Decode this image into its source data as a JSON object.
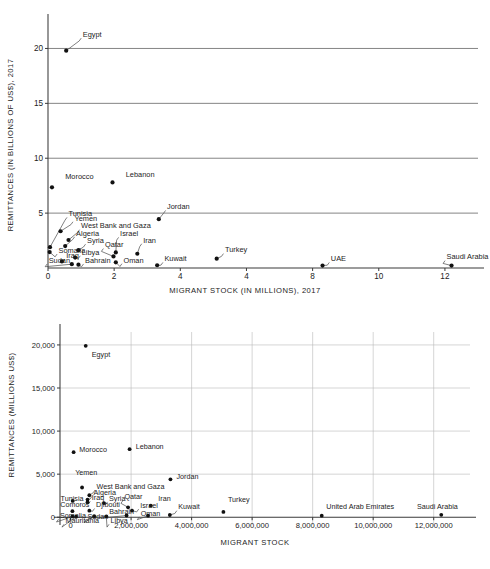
{
  "figure_top": {
    "y_axis_title": "REMITTANCES (IN BILLIONS OF US$), 2017",
    "x_axis_title": "MIGRANT STOCK (IN MILLIONS), 2017"
  },
  "figure_bottom": {
    "y_axis_title": "REMITTANCES (MILLIONS US$)",
    "x_axis_title": "MIGRANT STOCK"
  },
  "chart_data": [
    {
      "type": "scatter",
      "title": "",
      "xlabel": "MIGRANT STOCK (IN MILLIONS), 2017",
      "ylabel": "REMITTANCES (IN BILLIONS OF US$), 2017",
      "xlim": [
        0,
        13
      ],
      "ylim": [
        0,
        21.5
      ],
      "xticks": [
        0,
        2,
        4,
        6,
        8,
        10,
        12
      ],
      "xtick_labels": [
        "0",
        "2",
        "4",
        "4",
        "8",
        "10",
        "12"
      ],
      "yticks": [
        5,
        10,
        15,
        20
      ],
      "ytick_labels": [
        "5",
        "10",
        "15",
        "20"
      ],
      "grid": "horizontal",
      "legend": "none",
      "points": [
        {
          "label": "Egypt",
          "x": 0.55,
          "y": 19.8,
          "lx": 1.05,
          "ly": 21.05,
          "anchor": "start",
          "leader": true
        },
        {
          "label": "Morocco",
          "x": 0.12,
          "y": 7.35,
          "lx": 0.52,
          "ly": 8.15,
          "anchor": "start",
          "leader": false
        },
        {
          "label": "Lebanon",
          "x": 1.95,
          "y": 7.8,
          "lx": 2.35,
          "ly": 8.3,
          "anchor": "start",
          "leader": false
        },
        {
          "label": "Jordan",
          "x": 3.35,
          "y": 4.45,
          "lx": 3.6,
          "ly": 5.35,
          "anchor": "start",
          "leader": true
        },
        {
          "label": "Tunisia",
          "x": 0.06,
          "y": 1.9,
          "lx": 0.62,
          "ly": 4.72,
          "anchor": "start",
          "leader": true
        },
        {
          "label": "Yemen",
          "x": 0.38,
          "y": 3.35,
          "lx": 0.8,
          "ly": 4.32,
          "anchor": "start",
          "leader": true
        },
        {
          "label": "West Bank and Gaza",
          "x": 0.62,
          "y": 2.55,
          "lx": 1.0,
          "ly": 3.6,
          "anchor": "start",
          "leader": true
        },
        {
          "label": "Algeria",
          "x": 0.52,
          "y": 2.0,
          "lx": 0.85,
          "ly": 2.95,
          "anchor": "start",
          "leader": true
        },
        {
          "label": "Syria",
          "x": 0.92,
          "y": 1.62,
          "lx": 1.18,
          "ly": 2.28,
          "anchor": "start",
          "leader": true
        },
        {
          "label": "Israel",
          "x": 2.05,
          "y": 1.42,
          "lx": 2.18,
          "ly": 2.9,
          "anchor": "start",
          "leader": true
        },
        {
          "label": "Iran",
          "x": 2.7,
          "y": 1.3,
          "lx": 2.88,
          "ly": 2.32,
          "anchor": "start",
          "leader": true
        },
        {
          "label": "Qatar",
          "x": 1.98,
          "y": 1.05,
          "lx": 1.72,
          "ly": 1.88,
          "anchor": "start",
          "leader": true
        },
        {
          "label": "Somalia",
          "x": 0.05,
          "y": 1.45,
          "lx": 0.32,
          "ly": 1.38,
          "anchor": "start",
          "leader": true
        },
        {
          "label": "Libya",
          "x": 0.82,
          "y": 0.95,
          "lx": 1.02,
          "ly": 1.22,
          "anchor": "start",
          "leader": true
        },
        {
          "label": "Iraq",
          "x": 0.42,
          "y": 0.6,
          "lx": 0.55,
          "ly": 0.92,
          "anchor": "start",
          "leader": true
        },
        {
          "label": "Sudan",
          "x": 0.72,
          "y": 0.35,
          "lx": 0.02,
          "ly": 0.48,
          "anchor": "start",
          "leader": true
        },
        {
          "label": "Bahrain",
          "x": 0.92,
          "y": 0.3,
          "lx": 1.12,
          "ly": 0.48,
          "anchor": "start",
          "leader": true
        },
        {
          "label": "Oman",
          "x": 2.05,
          "y": 0.52,
          "lx": 2.28,
          "ly": 0.5,
          "anchor": "start",
          "leader": true
        },
        {
          "label": "Kuwait",
          "x": 3.3,
          "y": 0.25,
          "lx": 3.52,
          "ly": 0.62,
          "anchor": "start",
          "leader": true
        },
        {
          "label": "Turkey",
          "x": 5.1,
          "y": 0.85,
          "lx": 5.35,
          "ly": 1.42,
          "anchor": "start",
          "leader": true
        },
        {
          "label": "UAE",
          "x": 8.3,
          "y": 0.22,
          "lx": 8.55,
          "ly": 0.62,
          "anchor": "start",
          "leader": true
        },
        {
          "label": "Saudi Arabia",
          "x": 12.2,
          "y": 0.22,
          "lx": 12.05,
          "ly": 0.78,
          "anchor": "start",
          "leader": true
        }
      ]
    },
    {
      "type": "scatter",
      "title": "",
      "xlabel": "MIGRANT STOCK",
      "ylabel": "REMITTANCES (MILLIONS US$)",
      "xlim": [
        -350000,
        13200000
      ],
      "ylim": [
        -900,
        21500
      ],
      "xticks": [
        0,
        2000000,
        4000000,
        6000000,
        8000000,
        10000000,
        12000000
      ],
      "xtick_labels": [
        "0",
        "2,000,000",
        "4,000,000",
        "6,000,000",
        "8,000,000",
        "10,000,000",
        "12,000,000"
      ],
      "yticks": [
        0,
        5000,
        10000,
        15000,
        20000
      ],
      "ytick_labels": [
        "0",
        "5,000",
        "10,000",
        "15,000",
        "20,000"
      ],
      "grid": "both",
      "legend": "none",
      "points": [
        {
          "label": "Egypt",
          "x": 500000,
          "y": 19900,
          "lx": 700000,
          "ly": 18650,
          "anchor": "start",
          "leader": false
        },
        {
          "label": "Morocco",
          "x": 100000,
          "y": 7550,
          "lx": 290000,
          "ly": 7550,
          "anchor": "start",
          "leader": false
        },
        {
          "label": "Lebanon",
          "x": 1950000,
          "y": 7900,
          "lx": 2150000,
          "ly": 7900,
          "anchor": "start",
          "leader": false
        },
        {
          "label": "Jordan",
          "x": 3300000,
          "y": 4400,
          "lx": 3500000,
          "ly": 4400,
          "anchor": "start",
          "leader": false
        },
        {
          "label": "Yemen",
          "x": 380000,
          "y": 3450,
          "lx": 150000,
          "ly": 4850,
          "anchor": "start",
          "leader": false
        },
        {
          "label": "West Bank and Gaza",
          "x": 620000,
          "y": 2550,
          "lx": 860000,
          "ly": 3300,
          "anchor": "start",
          "leader": true
        },
        {
          "label": "Algeria",
          "x": 560000,
          "y": 2050,
          "lx": 760000,
          "ly": 2580,
          "anchor": "start",
          "leader": true
        },
        {
          "label": "Tunisia",
          "x": 70000,
          "y": 1900,
          "lx": -330000,
          "ly": 1940,
          "anchor": "start",
          "leader": false
        },
        {
          "label": "Iraq",
          "x": 560000,
          "y": 1740,
          "lx": 700000,
          "ly": 1980,
          "anchor": "start",
          "leader": true
        },
        {
          "label": "Syria",
          "x": 1100000,
          "y": 1640,
          "lx": 1270000,
          "ly": 1920,
          "anchor": "start",
          "leader": true
        },
        {
          "label": "Qatar",
          "x": 1900000,
          "y": 1150,
          "lx": 1780000,
          "ly": 2080,
          "anchor": "start",
          "leader": true
        },
        {
          "label": "Iran",
          "x": 2650000,
          "y": 1350,
          "lx": 2900000,
          "ly": 1920,
          "anchor": "start",
          "leader": false
        },
        {
          "label": "Comoros",
          "x": 60000,
          "y": 700,
          "lx": -340000,
          "ly": 1180,
          "anchor": "start",
          "leader": false
        },
        {
          "label": "Djibouti",
          "x": 620000,
          "y": 760,
          "lx": 840000,
          "ly": 1150,
          "anchor": "start",
          "leader": true
        },
        {
          "label": "Israel",
          "x": 2030000,
          "y": 780,
          "lx": 2300000,
          "ly": 1080,
          "anchor": "start",
          "leader": true
        },
        {
          "label": "Kuwait",
          "x": 3280000,
          "y": 260,
          "lx": 3560000,
          "ly": 900,
          "anchor": "start",
          "leader": true
        },
        {
          "label": "Turkey",
          "x": 5050000,
          "y": 620,
          "lx": 5200000,
          "ly": 1750,
          "anchor": "start",
          "leader": false
        },
        {
          "label": "Bahrain",
          "x": 1850000,
          "y": 200,
          "lx": 1280000,
          "ly": 420,
          "anchor": "start",
          "leader": true
        },
        {
          "label": "Oman",
          "x": 2560000,
          "y": 180,
          "lx": 2320000,
          "ly": 180,
          "anchor": "start",
          "leader": true
        },
        {
          "label": "Somalia",
          "x": 60000,
          "y": 90,
          "lx": -350000,
          "ly": -90,
          "anchor": "start",
          "leader": true
        },
        {
          "label": "Sudan",
          "x": 780000,
          "y": 130,
          "lx": 560000,
          "ly": -160,
          "anchor": "start",
          "leader": true
        },
        {
          "label": "Mauritania",
          "x": 180000,
          "y": 60,
          "lx": -170000,
          "ly": -680,
          "anchor": "start",
          "leader": true
        },
        {
          "label": "Libya",
          "x": 1180000,
          "y": 110,
          "lx": 1320000,
          "ly": -680,
          "anchor": "start",
          "leader": true
        },
        {
          "label": "United Arab Emirates",
          "x": 8300000,
          "y": 180,
          "lx": 8450000,
          "ly": 900,
          "anchor": "start",
          "leader": false
        },
        {
          "label": "Saudi Arabia",
          "x": 12250000,
          "y": 280,
          "lx": 11450000,
          "ly": 900,
          "anchor": "start",
          "leader": false
        }
      ]
    }
  ]
}
